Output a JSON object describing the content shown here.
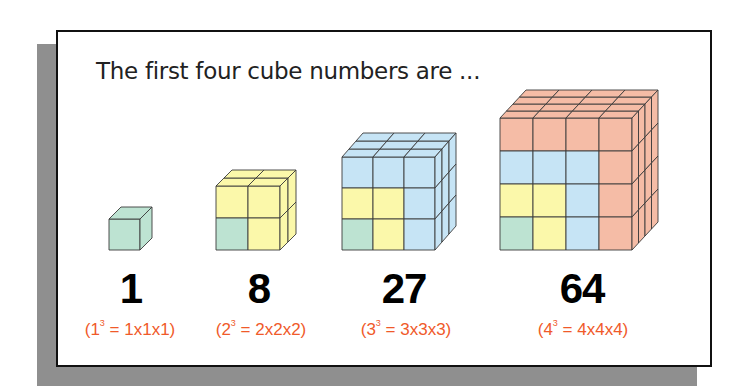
{
  "title": "The first four cube numbers are ...",
  "colors": {
    "green": "#bde3d2",
    "yellow": "#fbf8aa",
    "blue": "#c6e4f5",
    "salmon": "#f5bca6",
    "formula": "#f05a2a",
    "edge": "#3b3b3b"
  },
  "cubes": [
    {
      "value": "1",
      "base": "1",
      "exp": "3",
      "expansion": "= 1x1x1)",
      "open": "(",
      "center_x": 131
    },
    {
      "value": "8",
      "base": "2",
      "exp": "3",
      "expansion": "= 2x2x2)",
      "open": "(",
      "center_x": 259
    },
    {
      "value": "27",
      "base": "3",
      "exp": "3",
      "expansion": "= 3x3x3)",
      "open": "(",
      "center_x": 407
    },
    {
      "value": "64",
      "base": "4",
      "exp": "3",
      "expansion": "= 4x4x4)",
      "open": "(",
      "center_x": 584
    }
  ]
}
